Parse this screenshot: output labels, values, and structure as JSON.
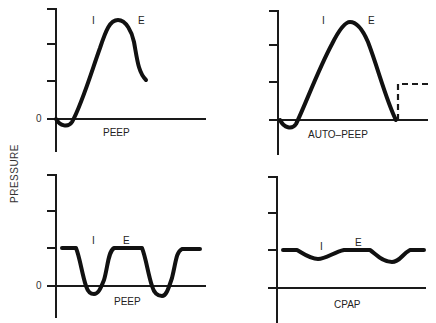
{
  "y_axis_label": "PRESSURE",
  "zero_label": "0",
  "panels": [
    {
      "id": "top-left",
      "caption": "PEEP",
      "phase_inspiration": "I",
      "phase_expiration": "E",
      "show_zero": true,
      "curve_type": "positive-pressure-breath"
    },
    {
      "id": "top-right",
      "caption": "AUTO–PEEP",
      "phase_inspiration": "I",
      "phase_expiration": "E",
      "show_zero": false,
      "curve_type": "positive-pressure-breath-with-auto-peep"
    },
    {
      "id": "bottom-left",
      "caption": "PEEP",
      "phase_inspiration": "I",
      "phase_expiration": "E",
      "show_zero": true,
      "curve_type": "spontaneous-breathing-with-peep"
    },
    {
      "id": "bottom-right",
      "caption": "CPAP",
      "phase_inspiration": "I",
      "phase_expiration": "E",
      "show_zero": false,
      "curve_type": "cpap"
    }
  ]
}
